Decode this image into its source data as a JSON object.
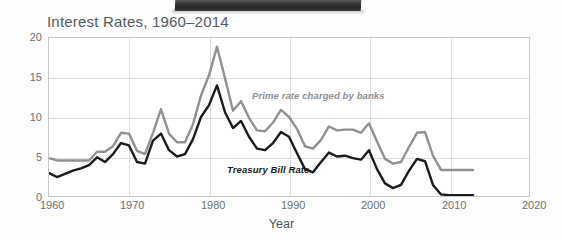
{
  "figure": {
    "title_text": "Interest Rates, 1960–2014",
    "xlabel": "Year",
    "ylabel": "Percent"
  },
  "axis": {
    "y_ticks": [
      "0",
      "5",
      "10",
      "15",
      "20"
    ],
    "x_ticks": [
      "1960",
      "1970",
      "1980",
      "1990",
      "2000",
      "2010",
      "2020"
    ]
  },
  "labels": {
    "prime": "Prime rate charged by banks",
    "tbill": "Treasury Bill Rate"
  },
  "colors": {
    "prime_line": "#8f9194",
    "tbill_line": "#1b1b1b",
    "grid": "#dcdee0",
    "frame": "#c6c8ca",
    "title_text": "#555a5d",
    "tick_text": "#6d7276"
  },
  "chart_data": {
    "type": "line",
    "title": "Interest Rates, 1960–2014",
    "xlabel": "Year",
    "ylabel": "Percent",
    "xlim": [
      1960,
      2020
    ],
    "ylim": [
      0,
      20
    ],
    "y_ticks": [
      0,
      5,
      10,
      15,
      20
    ],
    "x_ticks": [
      1960,
      1970,
      1980,
      1990,
      2000,
      2010,
      2020
    ],
    "grid": true,
    "legend": "inline-annotations",
    "x": [
      1960,
      1961,
      1962,
      1963,
      1964,
      1965,
      1966,
      1967,
      1968,
      1969,
      1970,
      1971,
      1972,
      1973,
      1974,
      1975,
      1976,
      1977,
      1978,
      1979,
      1980,
      1981,
      1982,
      1983,
      1984,
      1985,
      1986,
      1987,
      1988,
      1989,
      1990,
      1991,
      1992,
      1993,
      1994,
      1995,
      1996,
      1997,
      1998,
      1999,
      2000,
      2001,
      2002,
      2003,
      2004,
      2005,
      2006,
      2007,
      2008,
      2009,
      2010,
      2011,
      2012,
      2013
    ],
    "series": [
      {
        "name": "Prime rate charged by banks",
        "color": "#8f9194",
        "values": [
          4.8,
          4.5,
          4.5,
          4.5,
          4.5,
          4.5,
          5.6,
          5.6,
          6.3,
          8.0,
          7.9,
          5.7,
          5.3,
          8.0,
          11.0,
          7.9,
          6.8,
          6.8,
          9.1,
          12.7,
          15.3,
          18.9,
          14.9,
          10.8,
          12.0,
          9.9,
          8.3,
          8.2,
          9.3,
          10.9,
          10.0,
          8.5,
          6.3,
          6.0,
          7.1,
          8.8,
          8.3,
          8.4,
          8.4,
          8.0,
          9.2,
          6.9,
          4.7,
          4.1,
          4.3,
          6.2,
          8.0,
          8.1,
          5.1,
          3.3,
          3.3,
          3.3,
          3.3,
          3.3
        ]
      },
      {
        "name": "Treasury Bill Rate",
        "color": "#1b1b1b",
        "values": [
          2.9,
          2.4,
          2.8,
          3.2,
          3.5,
          3.9,
          4.9,
          4.3,
          5.3,
          6.7,
          6.4,
          4.3,
          4.1,
          7.0,
          7.9,
          5.8,
          5.0,
          5.3,
          7.2,
          10.0,
          11.5,
          14.0,
          10.6,
          8.6,
          9.5,
          7.5,
          6.0,
          5.8,
          6.7,
          8.1,
          7.5,
          5.4,
          3.4,
          3.0,
          4.3,
          5.5,
          5.0,
          5.1,
          4.8,
          4.6,
          5.8,
          3.4,
          1.6,
          1.0,
          1.4,
          3.2,
          4.7,
          4.4,
          1.4,
          0.2,
          0.1,
          0.1,
          0.1,
          0.1
        ]
      }
    ]
  }
}
